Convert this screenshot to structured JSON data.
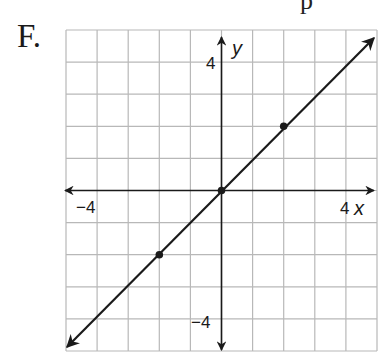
{
  "question": {
    "choice_label": "F.",
    "top_fragment": "p"
  },
  "chart_data": {
    "type": "line",
    "title": "",
    "equation": "y = x",
    "xlabel": "x",
    "ylabel": "y",
    "xlim": [
      -5,
      5
    ],
    "ylim": [
      -5,
      5
    ],
    "grid": true,
    "grid_step": 1,
    "tick_labels": {
      "x": [
        {
          "value": -4,
          "label": "−4"
        },
        {
          "value": 4,
          "label": "4"
        }
      ],
      "y": [
        {
          "value": 4,
          "label": "4"
        },
        {
          "value": -4,
          "label": "−4"
        }
      ]
    },
    "series": [
      {
        "name": "line",
        "points": [
          {
            "x": -2,
            "y": -2
          },
          {
            "x": 0,
            "y": 0
          },
          {
            "x": 2,
            "y": 2
          }
        ],
        "arrows_both_ends": true,
        "extent": {
          "from": {
            "x": -5,
            "y": -5
          },
          "to": {
            "x": 5,
            "y": 5
          }
        }
      }
    ],
    "colors": {
      "grid": "#b8b8b8",
      "axes": "#1a1a1a",
      "line": "#1a1a1a"
    }
  }
}
